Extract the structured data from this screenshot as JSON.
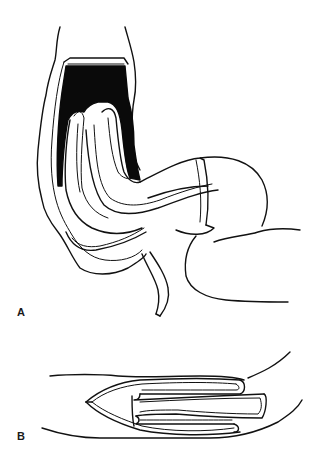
{
  "figure": {
    "panels": [
      {
        "id": "A",
        "label": "A",
        "description": "Intussusception of bowel segment, longitudinal view with telescoped loop inside colon"
      },
      {
        "id": "B",
        "label": "B",
        "description": "Intussusception, horizontal cross-section showing invaginated bowel folds"
      }
    ],
    "colors": {
      "line": "#111111",
      "fill_dark": "#0a0a0a",
      "background": "#ffffff"
    }
  }
}
